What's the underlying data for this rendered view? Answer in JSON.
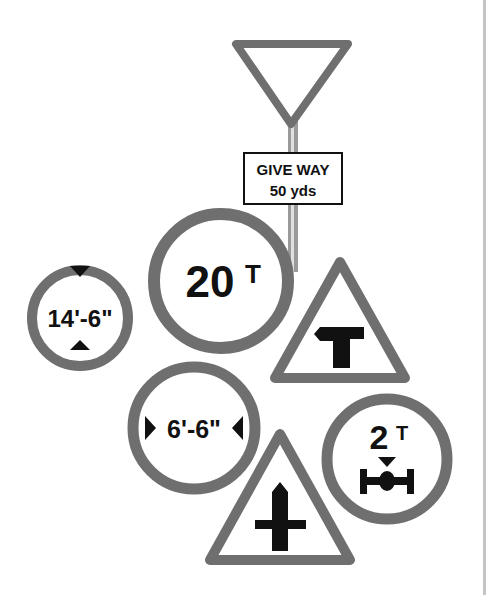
{
  "colors": {
    "border": "#6f6f6f",
    "symbol": "#111111",
    "background": "#ffffff",
    "post": "#8a8a8a",
    "edge_line": "#c4c4c4"
  },
  "signs": {
    "give_way": {
      "type": "inverted-triangle",
      "plate_line1": "GIVE WAY",
      "plate_line2": "50 yds"
    },
    "max_height": {
      "type": "circle",
      "label": "14'-6\""
    },
    "weight_limit": {
      "type": "circle",
      "number": "20",
      "unit": "T"
    },
    "t_junction": {
      "type": "warning-triangle",
      "symbol": "t-junction-icon"
    },
    "max_width": {
      "type": "circle",
      "label": "6'-6\""
    },
    "axle_weight": {
      "type": "circle",
      "number": "2",
      "unit": "T",
      "symbol": "axle-icon"
    },
    "crossroads": {
      "type": "warning-triangle",
      "symbol": "crossroads-icon"
    }
  }
}
